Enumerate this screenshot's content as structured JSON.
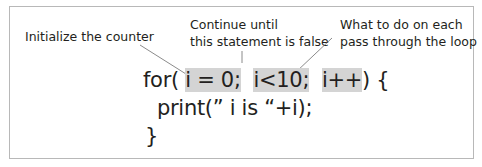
{
  "annotations": {
    "init": "Initialize the counter",
    "cond_line1": "Continue until",
    "cond_line2": "this statement is false",
    "step_line1": "What to do on each",
    "step_line2": "pass through the loop"
  },
  "code": {
    "for_kw": "for(",
    "init": "i = 0;",
    "cond": "i<10;",
    "step": "i++",
    "close_paren": ") {",
    "body": "print(” i is “+i);",
    "close_brace": "}"
  },
  "colors": {
    "highlight": "#d4d4d4",
    "text": "#231f20",
    "frame": "#b8b8b8"
  }
}
